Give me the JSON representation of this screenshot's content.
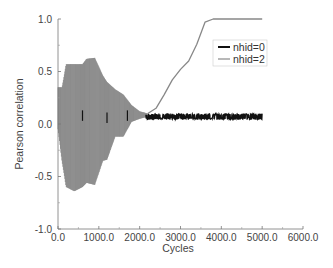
{
  "chart_data": {
    "type": "line",
    "title": "",
    "xlabel": "Cycles",
    "ylabel": "Pearson correlation",
    "xlim": [
      0,
      6000
    ],
    "ylim": [
      -1.0,
      1.0
    ],
    "x_ticks": [
      "0.0",
      "1000.0",
      "2000.0",
      "3000.0",
      "4000.0",
      "5000.0",
      "6000.0"
    ],
    "y_ticks": [
      "-1.0",
      "-0.5",
      "0.0",
      "0.5",
      "1.0"
    ],
    "grid": false,
    "legend_position": "upper right",
    "series": [
      {
        "name": "nhid=0",
        "color": "#111111",
        "description": "Oscillates tightly around ~0.07 from ~2200 to 5000 cycles",
        "x": [
          0,
          500,
          1000,
          1500,
          2000,
          2200,
          2500,
          3000,
          3500,
          4000,
          4500,
          5000
        ],
        "y": [
          0.05,
          0.05,
          0.05,
          0.05,
          0.06,
          0.07,
          0.07,
          0.07,
          0.07,
          0.07,
          0.07,
          0.07
        ],
        "band": 0.03
      },
      {
        "name": "nhid=2",
        "color": "#888888",
        "description": "Large oscillating envelope early (±0.6), damping to ~0.1 by 2000, then sigmoidal rise to 1.0 by ~3700 cycles",
        "envelope": {
          "x": [
            0,
            100,
            200,
            400,
            600,
            700,
            900,
            1100,
            1200,
            1400,
            1600,
            1800,
            2000,
            2200
          ],
          "upper": [
            0.35,
            0.35,
            0.57,
            0.57,
            0.57,
            0.62,
            0.63,
            0.46,
            0.4,
            0.33,
            0.28,
            0.18,
            0.12,
            0.1
          ],
          "lower": [
            -0.05,
            -0.36,
            -0.6,
            -0.64,
            -0.6,
            -0.56,
            -0.58,
            -0.35,
            -0.34,
            -0.12,
            -0.12,
            0.02,
            0.05,
            0.07
          ]
        },
        "x": [
          2200,
          2400,
          2600,
          2800,
          3000,
          3200,
          3400,
          3600,
          3800,
          4000,
          4500,
          5000
        ],
        "y": [
          0.1,
          0.15,
          0.28,
          0.42,
          0.52,
          0.6,
          0.76,
          0.97,
          1.0,
          1.0,
          1.0,
          1.0
        ]
      }
    ]
  }
}
